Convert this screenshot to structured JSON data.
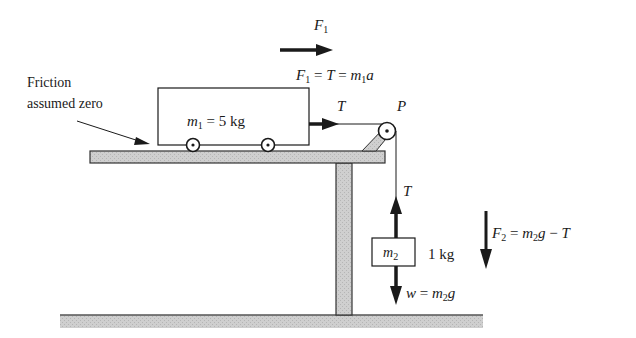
{
  "diagram": {
    "type": "physics-free-body",
    "colors": {
      "ink": "#1a1a1a",
      "surface_fill": "#c8c8c8",
      "background": "#ffffff"
    },
    "annotations": {
      "friction_line1": "Friction",
      "friction_line2": "assumed zero"
    },
    "cart": {
      "mass_symbol": "m",
      "mass_sub": "1",
      "mass_value": " = 5 kg"
    },
    "hanging_mass": {
      "symbol": "m",
      "sub": "2",
      "value_label": "1 kg"
    },
    "pulley": {
      "label": "P"
    },
    "forces": {
      "f1_label": {
        "sym": "F",
        "sub": "1"
      },
      "f1_equation": {
        "f": "F",
        "f_sub": "1",
        "rest1": " = ",
        "t": "T",
        "rest2": " = ",
        "m": "m",
        "m_sub": "1",
        "a": "a"
      },
      "tension_horizontal": "T",
      "tension_vertical": "T",
      "weight_equation": {
        "w": "w",
        "eq": " = ",
        "m": "m",
        "m_sub": "2",
        "g": "g"
      },
      "f2_equation": {
        "f": "F",
        "f_sub": "2",
        "eq": " = ",
        "m": "m",
        "m_sub": "2",
        "g": "g",
        "minus": " − ",
        "t": "T"
      }
    }
  }
}
